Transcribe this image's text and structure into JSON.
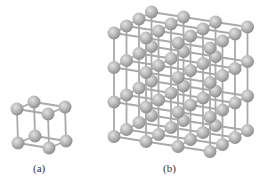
{
  "figure": {
    "panels": [
      {
        "id": "a",
        "label": "(a)",
        "description": "simple cubic unit cell",
        "lattice": {
          "nx": 2,
          "ny": 2,
          "nz": 2
        },
        "origin": [
          17,
          109
        ],
        "step_x": [
          31,
          5
        ],
        "step_y": [
          1,
          34
        ],
        "step_z": [
          17,
          -7
        ],
        "atom_radius": 6.5,
        "label_pos": [
          33,
          163
        ]
      },
      {
        "id": "b",
        "label": "(b)",
        "description": "simple cubic lattice of repeating unit cells",
        "lattice": {
          "nx": 4,
          "ny": 4,
          "nz": 4
        },
        "origin": [
          114,
          33
        ],
        "step_x": [
          32,
          5
        ],
        "step_y": [
          0,
          34.5
        ],
        "step_z": [
          12.5,
          -7
        ],
        "atom_radius": 6.5,
        "label_pos": [
          163,
          163
        ]
      }
    ],
    "colors": {
      "atom_fill": "#b8b8b8",
      "atom_highlight": "#e2e2e2",
      "atom_shadow": "#8e8e8e",
      "bond": "#a9a9a9",
      "label": "#333333",
      "background": "#ffffff"
    }
  }
}
